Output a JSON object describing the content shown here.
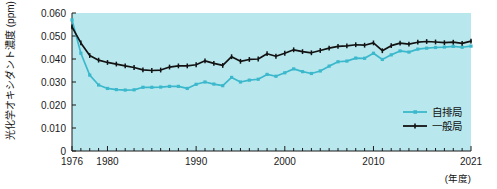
{
  "chart_data": {
    "type": "line",
    "title": "",
    "subtitle": "",
    "xlabel": "(年度)",
    "ylabel": "光化学オキシダント濃度 (ppm)",
    "xlim": [
      1976,
      2021
    ],
    "ylim": [
      0,
      0.06
    ],
    "grid": false,
    "plot_background": "#b8e8ee",
    "legend_position": "bottom-right",
    "x": [
      1976,
      1977,
      1978,
      1979,
      1980,
      1981,
      1982,
      1983,
      1984,
      1985,
      1986,
      1987,
      1988,
      1989,
      1990,
      1991,
      1992,
      1993,
      1994,
      1995,
      1996,
      1997,
      1998,
      1999,
      2000,
      2001,
      2002,
      2003,
      2004,
      2005,
      2006,
      2007,
      2008,
      2009,
      2010,
      2011,
      2012,
      2013,
      2014,
      2015,
      2016,
      2017,
      2018,
      2019,
      2020,
      2021
    ],
    "x_tick_labels": [
      "1976",
      "1980",
      "1990",
      "2000",
      "2010",
      "2021"
    ],
    "x_tick_values": [
      1976,
      1980,
      1990,
      2000,
      2010,
      2021
    ],
    "y_tick_labels": [
      "0",
      "0.010",
      "0.020",
      "0.030",
      "0.040",
      "0.050",
      "0.060"
    ],
    "y_tick_values": [
      0,
      0.01,
      0.02,
      0.03,
      0.04,
      0.05,
      0.06
    ],
    "series": [
      {
        "name": "自排局",
        "color": "#3cb8cc",
        "marker": "square",
        "values": [
          0.057,
          0.0425,
          0.033,
          0.0287,
          0.0272,
          0.0267,
          0.0265,
          0.0266,
          0.0277,
          0.0277,
          0.0278,
          0.0281,
          0.0281,
          0.0272,
          0.029,
          0.03,
          0.0291,
          0.0284,
          0.032,
          0.03,
          0.0308,
          0.0312,
          0.0333,
          0.0325,
          0.034,
          0.0357,
          0.0345,
          0.0337,
          0.0348,
          0.0369,
          0.0388,
          0.0391,
          0.0404,
          0.0403,
          0.0425,
          0.0398,
          0.0418,
          0.0435,
          0.043,
          0.0443,
          0.0447,
          0.045,
          0.0452,
          0.0455,
          0.0451,
          0.0456
        ]
      },
      {
        "name": "一般局",
        "color": "#121212",
        "marker": "plus",
        "values": [
          0.054,
          0.047,
          0.0415,
          0.0395,
          0.0385,
          0.0378,
          0.037,
          0.0363,
          0.0353,
          0.035,
          0.0352,
          0.0365,
          0.037,
          0.037,
          0.0375,
          0.0392,
          0.0381,
          0.0372,
          0.041,
          0.039,
          0.0398,
          0.04,
          0.0423,
          0.0412,
          0.0425,
          0.044,
          0.0432,
          0.0427,
          0.0437,
          0.0447,
          0.0455,
          0.0457,
          0.0462,
          0.046,
          0.047,
          0.0436,
          0.0458,
          0.0469,
          0.0465,
          0.0473,
          0.0476,
          0.0474,
          0.0471,
          0.0473,
          0.0468,
          0.0478
        ]
      }
    ]
  },
  "legend": {
    "items": [
      {
        "label": "自排局",
        "color": "#3cb8cc"
      },
      {
        "label": "一般局",
        "color": "#121212"
      }
    ]
  }
}
